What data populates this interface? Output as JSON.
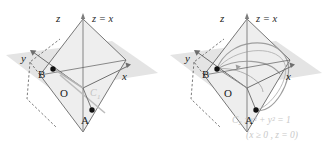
{
  "figure": {
    "background_color": "#ffffff",
    "ink_color": "#1b1b1b",
    "faint_color": "#c9c9c9",
    "plane_fill": "#e6e6e6",
    "tilted_plane_fill": "#f0f0f0",
    "curve_color": "#9b9b9b"
  },
  "panels": [
    {
      "id": "left",
      "axes": [
        {
          "name": "z-axis",
          "label": "z"
        },
        {
          "name": "y-axis",
          "label": "y"
        },
        {
          "name": "x-axis",
          "label": "x"
        }
      ],
      "plane_label": "z = x",
      "points": [
        {
          "name": "origin",
          "label": "O"
        },
        {
          "name": "point-a",
          "label": "A"
        },
        {
          "name": "point-b",
          "label": "B"
        }
      ],
      "curve_labels": [
        {
          "name": "curve-c1",
          "label": "C",
          "sub": "1"
        }
      ]
    },
    {
      "id": "right",
      "axes": [
        {
          "name": "z-axis",
          "label": "z"
        },
        {
          "name": "y-axis",
          "label": "y"
        },
        {
          "name": "x-axis",
          "label": "x"
        }
      ],
      "plane_label": "z = x",
      "points": [
        {
          "name": "origin",
          "label": "O"
        },
        {
          "name": "point-a",
          "label": "A"
        },
        {
          "name": "point-b",
          "label": "B"
        }
      ],
      "equation_lines": [
        {
          "name": "curve-c2-equation",
          "text": "C₂ : x² + y² = 1"
        },
        {
          "name": "curve-c2-domain",
          "text": "(x ≥ 0 , z = 0)"
        }
      ]
    }
  ]
}
